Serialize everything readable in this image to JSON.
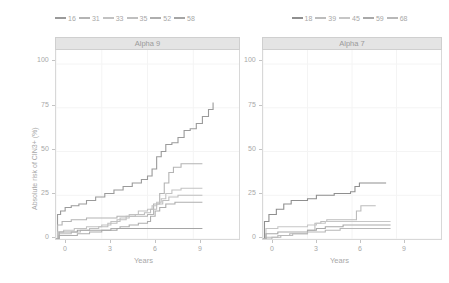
{
  "figure": {
    "width": 449,
    "height": 283,
    "background": "#ffffff",
    "ylabel": "Absolute risk of CIN3+ (%)",
    "xlabel": "Years"
  },
  "chart_data": {
    "type": "line",
    "title": "",
    "subtitle": "",
    "xlabel": "Years",
    "ylabel": "Absolute risk of CIN3+ (%)",
    "xlim": [
      0,
      12
    ],
    "ylim": [
      0,
      108
    ],
    "xticks": [
      "0",
      "3",
      "6",
      "9"
    ],
    "xtick_values": [
      0,
      3,
      6,
      9
    ],
    "yticks": [
      "0",
      "25",
      "50",
      "75",
      "100"
    ],
    "ytick_values": [
      0,
      25,
      50,
      75,
      100
    ],
    "grid": true,
    "legend_position": "top",
    "step_style": "hv",
    "panels": [
      {
        "label": "Alpha 9",
        "legend": [
          "16",
          "31",
          "33",
          "35",
          "52",
          "58"
        ],
        "series": [
          {
            "name": "16",
            "color": "#9a9a9a",
            "x": [
              0,
              0.1,
              0.3,
              0.6,
              1.0,
              1.5,
              2.0,
              2.6,
              3.2,
              3.8,
              4.4,
              5.0,
              5.6,
              6.0,
              6.3,
              6.6,
              6.9,
              7.2,
              7.6,
              8.0,
              8.4,
              8.8,
              9.2,
              9.6,
              10.0,
              10.3
            ],
            "y": [
              0,
              14,
              16,
              18,
              19,
              20,
              22,
              24,
              26,
              28,
              30,
              32,
              34,
              36,
              40,
              47,
              50,
              54,
              55,
              58,
              62,
              63,
              66,
              70,
              74,
              78
            ]
          },
          {
            "name": "31",
            "color": "#b4b4b4",
            "x": [
              0,
              0.1,
              0.4,
              1.0,
              2.0,
              3.0,
              4.0,
              5.0,
              6.0,
              6.4,
              6.8,
              7.1,
              7.4,
              7.7,
              8.2,
              9.0,
              9.6
            ],
            "y": [
              0,
              8,
              10,
              11,
              12,
              12,
              13,
              13,
              14,
              20,
              26,
              32,
              38,
              41,
              43,
              43,
              43
            ]
          },
          {
            "name": "33",
            "color": "#c2c2c2",
            "x": [
              0,
              0.1,
              0.5,
              1.2,
              2.0,
              3.0,
              3.6,
              4.2,
              4.8,
              5.4,
              6.0,
              6.3,
              6.6,
              6.9,
              7.2,
              7.6,
              8.2,
              9.0,
              9.6
            ],
            "y": [
              0,
              4,
              5,
              6,
              7,
              8,
              10,
              12,
              14,
              16,
              17,
              19,
              21,
              23,
              26,
              28,
              29,
              29,
              29
            ]
          },
          {
            "name": "35",
            "color": "#bfbfbf",
            "x": [
              0,
              0.2,
              1.0,
              1.6,
              2.2,
              2.8,
              3.4,
              4.0,
              4.6,
              5.2,
              5.8,
              6.2,
              6.6,
              7.0,
              7.4,
              8.0,
              8.8,
              9.6
            ],
            "y": [
              0,
              3,
              4,
              5,
              6,
              7,
              9,
              11,
              13,
              14,
              15,
              17,
              20,
              22,
              24,
              25,
              25,
              25
            ]
          },
          {
            "name": "52",
            "color": "#aeaeae",
            "x": [
              0,
              0.2,
              1.4,
              2.2,
              3.0,
              3.6,
              4.2,
              4.8,
              5.4,
              6.0,
              6.2,
              6.5,
              6.8,
              7.2,
              7.8,
              8.6,
              9.6
            ],
            "y": [
              0,
              2,
              3,
              4,
              5,
              6,
              7,
              8,
              9,
              10,
              13,
              16,
              18,
              20,
              21,
              21,
              21
            ]
          },
          {
            "name": "58",
            "color": "#a5a5a5",
            "x": [
              0,
              0.2,
              1.4,
              2.6,
              4.0,
              5.2,
              6.2,
              7.0,
              8.0,
              9.0,
              9.6
            ],
            "y": [
              0,
              4,
              5,
              5,
              6,
              6,
              6,
              6,
              6,
              6,
              6
            ]
          }
        ]
      },
      {
        "label": "Alpha 7",
        "legend": [
          "18",
          "39",
          "45",
          "59",
          "68"
        ],
        "series": [
          {
            "name": "18",
            "color": "#8f8f8f",
            "x": [
              0,
              0.1,
              0.4,
              0.9,
              1.4,
              1.9,
              2.4,
              3.0,
              3.6,
              4.2,
              4.8,
              5.4,
              5.9,
              6.2,
              6.5,
              7.0,
              7.6,
              8.3
            ],
            "y": [
              0,
              10,
              14,
              17,
              20,
              22,
              22,
              23,
              25,
              25,
              26,
              26,
              27,
              30,
              32,
              32,
              32,
              32
            ]
          },
          {
            "name": "39",
            "color": "#bcbcbc",
            "x": [
              0,
              0.2,
              1.0,
              2.0,
              3.0,
              3.5,
              3.9,
              4.3,
              4.8,
              5.4,
              6.0,
              6.3,
              6.6,
              7.0,
              7.6
            ],
            "y": [
              0,
              1,
              2,
              3,
              5,
              9,
              10,
              11,
              11,
              11,
              11,
              16,
              19,
              19,
              19
            ]
          },
          {
            "name": "45",
            "color": "#c6c6c6",
            "x": [
              0,
              0.2,
              1.0,
              2.0,
              3.0,
              3.6,
              4.2,
              5.0,
              6.0,
              7.0,
              8.0,
              8.6
            ],
            "y": [
              0,
              6,
              7,
              7,
              8,
              9,
              10,
              10,
              10,
              10,
              10,
              10
            ]
          },
          {
            "name": "59",
            "color": "#a9a9a9",
            "x": [
              0,
              0.2,
              1.0,
              2.0,
              3.0,
              3.6,
              4.2,
              4.8,
              5.4,
              6.2,
              7.2,
              8.2,
              8.6
            ],
            "y": [
              0,
              3,
              4,
              4,
              5,
              6,
              7,
              7,
              8,
              8,
              8,
              8,
              8
            ]
          },
          {
            "name": "68",
            "color": "#b8b8b8",
            "x": [
              0,
              0.6,
              1.2,
              1.8,
              2.4,
              3.0,
              3.6,
              4.2,
              4.8,
              5.2,
              6.0,
              7.0,
              8.0,
              8.6
            ],
            "y": [
              0,
              1,
              2,
              3,
              3,
              4,
              4,
              5,
              5,
              6,
              6,
              6,
              6,
              6
            ]
          }
        ]
      }
    ]
  }
}
